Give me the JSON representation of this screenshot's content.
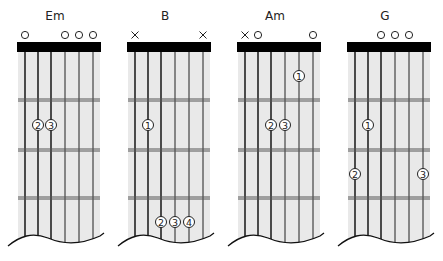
{
  "colors": {
    "fretboard": "#e9e9e9",
    "nut": "#000000",
    "string": "#222222",
    "fret": "#555555",
    "marker": "#222222"
  },
  "chords": [
    {
      "name": "Em",
      "left": 0,
      "open_mute": [
        "o",
        "",
        "",
        "o",
        "o",
        "o"
      ],
      "fingers": [
        {
          "string": 2,
          "fret": 2,
          "finger": "2"
        },
        {
          "string": 3,
          "fret": 2,
          "finger": "3"
        }
      ]
    },
    {
      "name": "B",
      "left": 110,
      "open_mute": [
        "x",
        "",
        "",
        "",
        "",
        "x"
      ],
      "fingers": [
        {
          "string": 2,
          "fret": 2,
          "finger": "1"
        },
        {
          "string": 3,
          "fret": 4,
          "finger": "2"
        },
        {
          "string": 4,
          "fret": 4,
          "finger": "3"
        },
        {
          "string": 5,
          "fret": 4,
          "finger": "4"
        }
      ]
    },
    {
      "name": "Am",
      "left": 220,
      "open_mute": [
        "x",
        "o",
        "",
        "",
        "",
        "o"
      ],
      "fingers": [
        {
          "string": 5,
          "fret": 1,
          "finger": "1"
        },
        {
          "string": 3,
          "fret": 2,
          "finger": "2"
        },
        {
          "string": 4,
          "fret": 2,
          "finger": "3"
        }
      ]
    },
    {
      "name": "G",
      "left": 330,
      "open_mute": [
        "",
        "",
        "o",
        "o",
        "o",
        ""
      ],
      "fingers": [
        {
          "string": 2,
          "fret": 2,
          "finger": "1"
        },
        {
          "string": 1,
          "fret": 3,
          "finger": "2"
        },
        {
          "string": 6,
          "fret": 3,
          "finger": "3"
        }
      ]
    }
  ]
}
